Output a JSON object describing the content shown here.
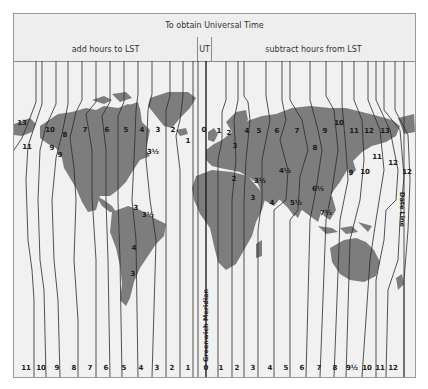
{
  "header": {
    "title": "To obtain Universal Time",
    "add_label": "add hours to LST",
    "ut_label": "UT",
    "subtract_label": "subtract hours from LST"
  },
  "annotations": {
    "greenwich": "Greenwich Meridian",
    "date_line": "Date Line"
  },
  "colors": {
    "land": "#7d7d7d",
    "sea": "#f2f2f2",
    "lines": "#2a2a2a",
    "frame": "#9a9a9a"
  },
  "bottom_scale": {
    "west": [
      "11",
      "10",
      "9",
      "8",
      "7",
      "6",
      "5",
      "4",
      "3",
      "2",
      "1"
    ],
    "center": "0",
    "east": [
      "1",
      "2",
      "3",
      "4",
      "5",
      "6",
      "7",
      "8",
      "9½",
      "10",
      "11",
      "12"
    ]
  },
  "zone_labels": [
    {
      "text": "13",
      "x": 22,
      "y": 125
    },
    {
      "text": "10",
      "x": 50,
      "y": 132
    },
    {
      "text": "11",
      "x": 27,
      "y": 149
    },
    {
      "text": "8",
      "x": 65,
      "y": 137
    },
    {
      "text": "9",
      "x": 52,
      "y": 150
    },
    {
      "text": "9",
      "x": 60,
      "y": 157
    },
    {
      "text": "7",
      "x": 85,
      "y": 132
    },
    {
      "text": "6",
      "x": 107,
      "y": 132
    },
    {
      "text": "5",
      "x": 126,
      "y": 132
    },
    {
      "text": "4",
      "x": 142,
      "y": 132
    },
    {
      "text": "3",
      "x": 158,
      "y": 132
    },
    {
      "text": "2",
      "x": 173,
      "y": 132
    },
    {
      "text": "1",
      "x": 188,
      "y": 143
    },
    {
      "text": "3½",
      "x": 153,
      "y": 154
    },
    {
      "text": "0",
      "x": 204,
      "y": 132
    },
    {
      "text": "1",
      "x": 219,
      "y": 133
    },
    {
      "text": "2",
      "x": 229,
      "y": 135
    },
    {
      "text": "3",
      "x": 235,
      "y": 148
    },
    {
      "text": "4",
      "x": 247,
      "y": 133
    },
    {
      "text": "5",
      "x": 259,
      "y": 133
    },
    {
      "text": "6",
      "x": 277,
      "y": 133
    },
    {
      "text": "7",
      "x": 297,
      "y": 133
    },
    {
      "text": "8",
      "x": 315,
      "y": 150
    },
    {
      "text": "9",
      "x": 325,
      "y": 133
    },
    {
      "text": "10",
      "x": 339,
      "y": 125
    },
    {
      "text": "11",
      "x": 354,
      "y": 133
    },
    {
      "text": "12",
      "x": 369,
      "y": 133
    },
    {
      "text": "13",
      "x": 385,
      "y": 133
    },
    {
      "text": "11",
      "x": 377,
      "y": 159
    },
    {
      "text": "12",
      "x": 393,
      "y": 165
    },
    {
      "text": "12",
      "x": 407,
      "y": 174
    },
    {
      "text": "9",
      "x": 351,
      "y": 175
    },
    {
      "text": "10",
      "x": 365,
      "y": 174
    },
    {
      "text": "2",
      "x": 234,
      "y": 181
    },
    {
      "text": "3½",
      "x": 260,
      "y": 183
    },
    {
      "text": "4½",
      "x": 285,
      "y": 173
    },
    {
      "text": "6½",
      "x": 318,
      "y": 191
    },
    {
      "text": "3",
      "x": 253,
      "y": 200
    },
    {
      "text": "4",
      "x": 272,
      "y": 205
    },
    {
      "text": "5½",
      "x": 296,
      "y": 205
    },
    {
      "text": "7½",
      "x": 326,
      "y": 215
    },
    {
      "text": "3",
      "x": 136,
      "y": 210
    },
    {
      "text": "3½",
      "x": 148,
      "y": 217
    },
    {
      "text": "4",
      "x": 134,
      "y": 250
    },
    {
      "text": "3",
      "x": 133,
      "y": 276
    }
  ],
  "legend_rows": [
    "add hours to LST",
    "UT",
    "subtract hours from LST"
  ]
}
